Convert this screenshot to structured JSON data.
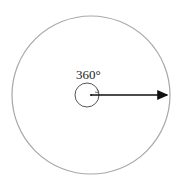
{
  "diagram": {
    "angle_label": "360°",
    "colors": {
      "outer_circle": "#a8a8a8",
      "inner_circle": "#555555",
      "arrow": "#111111"
    },
    "outer_circle": {
      "cx": 91,
      "cy": 95,
      "r": 79
    },
    "inner_arc": {
      "cx": 87,
      "cy": 95,
      "r": 12
    },
    "ray": {
      "from": [
        91,
        95
      ],
      "to": [
        168,
        95
      ]
    }
  }
}
